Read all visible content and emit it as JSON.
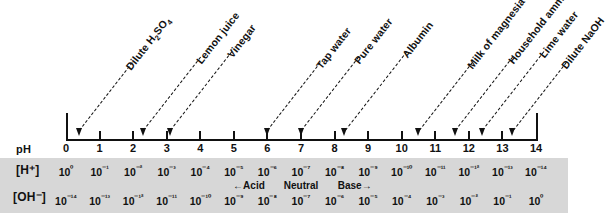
{
  "axis": {
    "label": "pH",
    "ticks": [
      "0",
      "1",
      "2",
      "3",
      "4",
      "5",
      "6",
      "7",
      "8",
      "9",
      "10",
      "11",
      "12",
      "13",
      "14"
    ],
    "min": 0,
    "max": 14
  },
  "rows": {
    "hydrogen_label": "[H⁺]",
    "hydroxide_label": "[OH⁻]",
    "hydrogen_values": [
      "10⁰",
      "10⁻¹",
      "10⁻²",
      "10⁻³",
      "10⁻⁴",
      "10⁻⁵",
      "10⁻⁶",
      "10⁻⁷",
      "10⁻⁸",
      "10⁻⁹",
      "10⁻¹⁰",
      "10⁻¹¹",
      "10⁻¹²",
      "10⁻¹³",
      "10⁻¹⁴"
    ],
    "hydroxide_values": [
      "10⁻¹⁴",
      "10⁻¹³",
      "10⁻¹²",
      "10⁻¹¹",
      "10⁻¹⁰",
      "10⁻⁹",
      "10⁻⁸",
      "10⁻⁷",
      "10⁻⁶",
      "10⁻⁵",
      "10⁻⁴",
      "10⁻³",
      "10⁻²",
      "10⁻¹",
      "10⁰"
    ]
  },
  "annotations": [
    {
      "text": "←Acid",
      "ph": 5.45
    },
    {
      "text": "Neutral",
      "ph": 7.0
    },
    {
      "text": "Base→",
      "ph": 8.6
    }
  ],
  "substances": [
    {
      "name": "Dilute H₂SO₄",
      "ph": 0.4
    },
    {
      "name": "Lemon juice",
      "ph": 2.3
    },
    {
      "name": "Vinegar",
      "ph": 3.1
    },
    {
      "name": "Tap water",
      "ph": 6.0
    },
    {
      "name": "Pure water",
      "ph": 7.0
    },
    {
      "name": "Albumin",
      "ph": 8.3
    },
    {
      "name": "Milk of magnesia",
      "ph": 10.5
    },
    {
      "name": "Household ammonia",
      "ph": 11.6
    },
    {
      "name": "Lime water",
      "ph": 12.4
    },
    {
      "name": "Dilute NaOH",
      "ph": 13.3
    }
  ],
  "chart_data": {
    "type": "line",
    "xlabel": "pH",
    "ylabel": "",
    "xlim": [
      0,
      14
    ],
    "grid": false,
    "legend": "none",
    "categories": [
      "0",
      "1",
      "2",
      "3",
      "4",
      "5",
      "6",
      "7",
      "8",
      "9",
      "10",
      "11",
      "12",
      "13",
      "14"
    ],
    "series": [
      {
        "name": "[H+]",
        "values": [
          "10^0",
          "10^-1",
          "10^-2",
          "10^-3",
          "10^-4",
          "10^-5",
          "10^-6",
          "10^-7",
          "10^-8",
          "10^-9",
          "10^-10",
          "10^-11",
          "10^-12",
          "10^-13",
          "10^-14"
        ]
      },
      {
        "name": "[OH-]",
        "values": [
          "10^-14",
          "10^-13",
          "10^-12",
          "10^-11",
          "10^-10",
          "10^-9",
          "10^-8",
          "10^-7",
          "10^-6",
          "10^-5",
          "10^-4",
          "10^-3",
          "10^-2",
          "10^-1",
          "10^0"
        ]
      }
    ],
    "annotations": [
      {
        "label": "Dilute H2SO4",
        "x": 0.4
      },
      {
        "label": "Lemon juice",
        "x": 2.3
      },
      {
        "label": "Vinegar",
        "x": 3.1
      },
      {
        "label": "Tap water",
        "x": 6.0
      },
      {
        "label": "Pure water",
        "x": 7.0
      },
      {
        "label": "Albumin",
        "x": 8.3
      },
      {
        "label": "Milk of magnesia",
        "x": 10.5
      },
      {
        "label": "Household ammonia",
        "x": 11.6
      },
      {
        "label": "Lime water",
        "x": 12.4
      },
      {
        "label": "Dilute NaOH",
        "x": 13.3
      },
      {
        "label": "Acid",
        "x": 5.45
      },
      {
        "label": "Neutral",
        "x": 7.0
      },
      {
        "label": "Base",
        "x": 8.6
      }
    ]
  },
  "colors": {
    "background": "#ffffff",
    "band": "#d7d7d7",
    "ink": "#111111"
  }
}
